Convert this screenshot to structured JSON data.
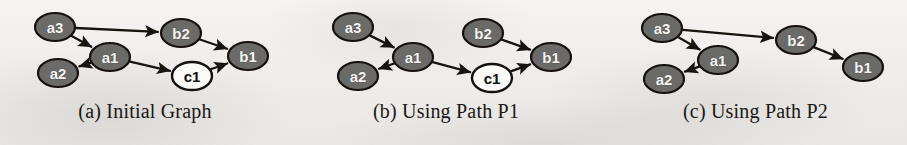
{
  "figure": {
    "background_color": "#f2f1ef",
    "node_fill_color": "#6a6a69",
    "node_open_fill_color": "#fbfbfa",
    "node_stroke_color": "#14110f",
    "edge_color": "#17140f",
    "label_light_color": "#f6f5f3",
    "label_dark_color": "#14110f"
  },
  "panels": [
    {
      "id": "panel-a",
      "caption": "(a) Initial Graph",
      "nodes": [
        {
          "id": "a3",
          "label": "a3",
          "style": "filled",
          "cx": 55,
          "cy": 27,
          "rx": 20,
          "ry": 14
        },
        {
          "id": "a1",
          "label": "a1",
          "style": "filled",
          "cx": 110,
          "cy": 57,
          "rx": 20,
          "ry": 14
        },
        {
          "id": "a2",
          "label": "a2",
          "style": "filled",
          "cx": 58,
          "cy": 73,
          "rx": 20,
          "ry": 14
        },
        {
          "id": "b2",
          "label": "b2",
          "style": "filled",
          "cx": 181,
          "cy": 33,
          "rx": 20,
          "ry": 14
        },
        {
          "id": "c1",
          "label": "c1",
          "style": "open",
          "cx": 192,
          "cy": 76,
          "rx": 20,
          "ry": 14
        },
        {
          "id": "b1",
          "label": "b1",
          "style": "filled",
          "cx": 248,
          "cy": 56,
          "rx": 20,
          "ry": 14
        }
      ],
      "edges": [
        {
          "from": "a3",
          "to": "b2"
        },
        {
          "from": "a3",
          "to": "a1"
        },
        {
          "from": "a1",
          "to": "a2"
        },
        {
          "from": "a1",
          "to": "c1"
        },
        {
          "from": "b2",
          "to": "b1"
        },
        {
          "from": "c1",
          "to": "b1"
        }
      ]
    },
    {
      "id": "panel-b",
      "caption": "(b) Using Path P1",
      "nodes": [
        {
          "id": "a3",
          "label": "a3",
          "style": "filled",
          "cx": 57,
          "cy": 27,
          "rx": 20,
          "ry": 14
        },
        {
          "id": "a1",
          "label": "a1",
          "style": "filled",
          "cx": 117,
          "cy": 57,
          "rx": 20,
          "ry": 14
        },
        {
          "id": "a2",
          "label": "a2",
          "style": "filled",
          "cx": 62,
          "cy": 76,
          "rx": 20,
          "ry": 14
        },
        {
          "id": "b2",
          "label": "b2",
          "style": "filled",
          "cx": 187,
          "cy": 33,
          "rx": 20,
          "ry": 14
        },
        {
          "id": "c1",
          "label": "c1",
          "style": "open",
          "cx": 196,
          "cy": 78,
          "rx": 20,
          "ry": 14
        },
        {
          "id": "b1",
          "label": "b1",
          "style": "filled",
          "cx": 255,
          "cy": 57,
          "rx": 20,
          "ry": 14
        }
      ],
      "edges": [
        {
          "from": "a3",
          "to": "a1"
        },
        {
          "from": "a1",
          "to": "a2"
        },
        {
          "from": "a1",
          "to": "c1"
        },
        {
          "from": "b2",
          "to": "b1"
        },
        {
          "from": "c1",
          "to": "b1"
        }
      ]
    },
    {
      "id": "panel-c",
      "caption": "(c) Using Path P2",
      "nodes": [
        {
          "id": "a3",
          "label": "a3",
          "style": "filled",
          "cx": 58,
          "cy": 28,
          "rx": 20,
          "ry": 14
        },
        {
          "id": "a1",
          "label": "a1",
          "style": "filled",
          "cx": 114,
          "cy": 60,
          "rx": 20,
          "ry": 14
        },
        {
          "id": "a2",
          "label": "a2",
          "style": "filled",
          "cx": 60,
          "cy": 79,
          "rx": 20,
          "ry": 14
        },
        {
          "id": "b2",
          "label": "b2",
          "style": "filled",
          "cx": 192,
          "cy": 40,
          "rx": 20,
          "ry": 14
        },
        {
          "id": "b1",
          "label": "b1",
          "style": "filled",
          "cx": 259,
          "cy": 67,
          "rx": 20,
          "ry": 14
        }
      ],
      "edges": [
        {
          "from": "a3",
          "to": "b2"
        },
        {
          "from": "a3",
          "to": "a1"
        },
        {
          "from": "a1",
          "to": "a2"
        },
        {
          "from": "b2",
          "to": "b1"
        }
      ]
    }
  ],
  "panel_layout": [
    {
      "left": 0,
      "width": 290
    },
    {
      "left": 296,
      "width": 300
    },
    {
      "left": 604,
      "width": 303
    }
  ]
}
